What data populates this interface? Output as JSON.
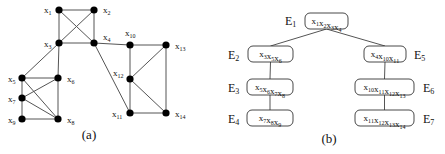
{
  "graph_a": {
    "caption": "(a)",
    "nodes": [
      {
        "id": "x1",
        "base": "x",
        "sub": "1",
        "x": 59,
        "y": 10,
        "lx": 44,
        "ly": 13
      },
      {
        "id": "x2",
        "base": "x",
        "sub": "2",
        "x": 94,
        "y": 10,
        "lx": 103,
        "ly": 13
      },
      {
        "id": "x3",
        "base": "x",
        "sub": "3",
        "x": 59,
        "y": 43,
        "lx": 44,
        "ly": 47
      },
      {
        "id": "x4",
        "base": "x",
        "sub": "4",
        "x": 94,
        "y": 43,
        "lx": 103,
        "ly": 40
      },
      {
        "id": "x5",
        "base": "x",
        "sub": "5",
        "x": 22,
        "y": 78,
        "lx": 8,
        "ly": 82
      },
      {
        "id": "x6",
        "base": "x",
        "sub": "6",
        "x": 58,
        "y": 78,
        "lx": 67,
        "ly": 82
      },
      {
        "id": "x7",
        "base": "x",
        "sub": "7",
        "x": 22,
        "y": 98,
        "lx": 8,
        "ly": 102
      },
      {
        "id": "x8",
        "base": "x",
        "sub": "8",
        "x": 58,
        "y": 119,
        "lx": 67,
        "ly": 123
      },
      {
        "id": "x9",
        "base": "x",
        "sub": "9",
        "x": 22,
        "y": 119,
        "lx": 8,
        "ly": 123
      },
      {
        "id": "x10",
        "base": "x",
        "sub": "10",
        "x": 130,
        "y": 45,
        "lx": 125,
        "ly": 36
      },
      {
        "id": "x11",
        "base": "x",
        "sub": "11",
        "x": 130,
        "y": 113,
        "lx": 112,
        "ly": 117
      },
      {
        "id": "x12",
        "base": "x",
        "sub": "12",
        "x": 130,
        "y": 79,
        "lx": 113,
        "ly": 76
      },
      {
        "id": "x13",
        "base": "x",
        "sub": "13",
        "x": 166,
        "y": 45,
        "lx": 175,
        "ly": 49
      },
      {
        "id": "x14",
        "base": "x",
        "sub": "14",
        "x": 166,
        "y": 113,
        "lx": 175,
        "ly": 117
      }
    ],
    "edges": [
      [
        "x1",
        "x2"
      ],
      [
        "x1",
        "x3"
      ],
      [
        "x1",
        "x4"
      ],
      [
        "x2",
        "x3"
      ],
      [
        "x2",
        "x4"
      ],
      [
        "x3",
        "x4"
      ],
      [
        "x3",
        "x5"
      ],
      [
        "x3",
        "x6"
      ],
      [
        "x5",
        "x6"
      ],
      [
        "x5",
        "x7"
      ],
      [
        "x5",
        "x8"
      ],
      [
        "x6",
        "x7"
      ],
      [
        "x6",
        "x8"
      ],
      [
        "x7",
        "x8"
      ],
      [
        "x7",
        "x9"
      ],
      [
        "x9",
        "x8"
      ],
      [
        "x4",
        "x10"
      ],
      [
        "x4",
        "x11"
      ],
      [
        "x10",
        "x13"
      ],
      [
        "x10",
        "x12"
      ],
      [
        "x12",
        "x11"
      ],
      [
        "x12",
        "x13"
      ],
      [
        "x12",
        "x14"
      ],
      [
        "x13",
        "x14"
      ],
      [
        "x11",
        "x14"
      ]
    ]
  },
  "tree_b": {
    "caption": "(b)",
    "nodes": [
      {
        "id": "E1",
        "label": "E",
        "label_sub": "1",
        "items": [
          [
            "x",
            "1"
          ],
          [
            "x",
            "2"
          ],
          [
            "x",
            "3"
          ],
          [
            "x",
            "4"
          ]
        ],
        "bx": 305,
        "by": 13,
        "bw": 43,
        "bh": 16,
        "lx": 285,
        "ly": 25
      },
      {
        "id": "E2",
        "label": "E",
        "label_sub": "2",
        "items": [
          [
            "x",
            "3"
          ],
          [
            "x",
            "5"
          ],
          [
            "x",
            "6"
          ]
        ],
        "bx": 248,
        "by": 46,
        "bw": 45,
        "bh": 16,
        "lx": 228,
        "ly": 59
      },
      {
        "id": "E3",
        "label": "E",
        "label_sub": "3",
        "items": [
          [
            "x",
            "5"
          ],
          [
            "x",
            "6"
          ],
          [
            "x",
            "7"
          ],
          [
            "x",
            "8"
          ]
        ],
        "bx": 247,
        "by": 79,
        "bw": 46,
        "bh": 16,
        "lx": 228,
        "ly": 92
      },
      {
        "id": "E4",
        "label": "E",
        "label_sub": "4",
        "items": [
          [
            "x",
            "7"
          ],
          [
            "x",
            "8"
          ],
          [
            "x",
            "9"
          ]
        ],
        "bx": 247,
        "by": 110,
        "bw": 46,
        "bh": 16,
        "lx": 228,
        "ly": 123
      },
      {
        "id": "E5",
        "label": "E",
        "label_sub": "5",
        "items": [
          [
            "x",
            "4"
          ],
          [
            "x",
            "10"
          ],
          [
            "x",
            "11"
          ]
        ],
        "bx": 364,
        "by": 46,
        "bw": 42,
        "bh": 16,
        "lx": 414,
        "ly": 59
      },
      {
        "id": "E6",
        "label": "E",
        "label_sub": "6",
        "items": [
          [
            "x",
            "10"
          ],
          [
            "x",
            "11"
          ],
          [
            "x",
            "12"
          ],
          [
            "x",
            "13"
          ]
        ],
        "bx": 355,
        "by": 79,
        "bw": 59,
        "bh": 16,
        "lx": 423,
        "ly": 92
      },
      {
        "id": "E7",
        "label": "E",
        "label_sub": "7",
        "items": [
          [
            "x",
            "11"
          ],
          [
            "x",
            "12"
          ],
          [
            "x",
            "13"
          ],
          [
            "x",
            "14"
          ]
        ],
        "bx": 355,
        "by": 110,
        "bw": 59,
        "bh": 16,
        "lx": 423,
        "ly": 123
      }
    ],
    "edges": [
      [
        "E1",
        "E2"
      ],
      [
        "E1",
        "E5"
      ],
      [
        "E2",
        "E3"
      ],
      [
        "E3",
        "E4"
      ],
      [
        "E5",
        "E6"
      ],
      [
        "E6",
        "E7"
      ]
    ]
  }
}
